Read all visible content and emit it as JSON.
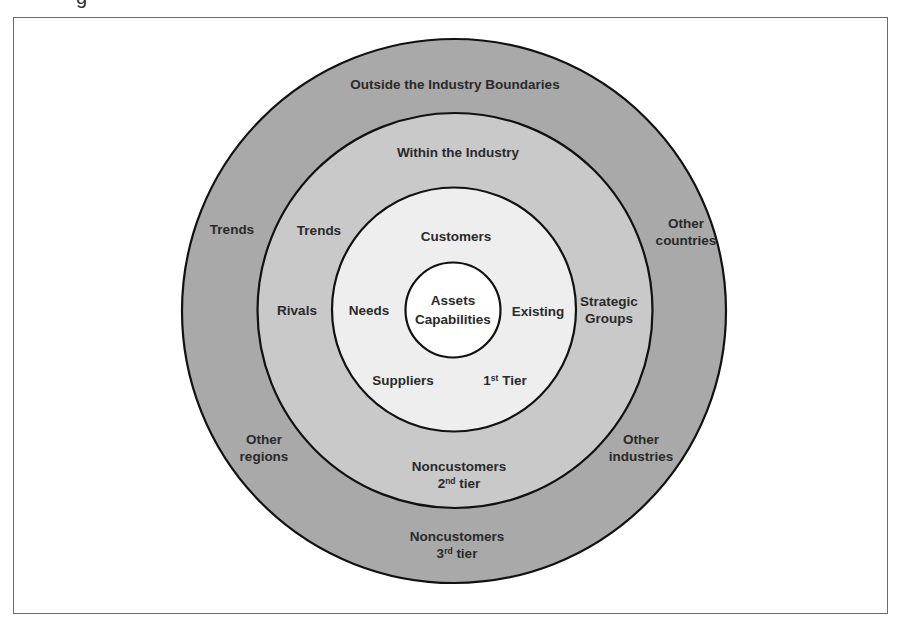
{
  "header": {
    "cut_off_glyph": "g"
  },
  "diagram": {
    "colors": {
      "outer_ring": "#a9a9a9",
      "middle_ring": "#c9c9c9",
      "inner_ring": "#eeeeee",
      "core": "#ffffff",
      "stroke": "#111111",
      "frame": "#6a6a6a"
    },
    "rings": {
      "outer": {
        "title": "Outside the Industry Boundaries"
      },
      "middle": {
        "title": "Within the Industry"
      },
      "inner": {
        "title": "Customers"
      },
      "core": {
        "line1": "Assets",
        "line2": "Capabilities"
      }
    },
    "labels": {
      "outer_trends": "Trends",
      "middle_trends": "Trends",
      "rivals": "Rivals",
      "needs": "Needs",
      "existing": "Existing",
      "suppliers": "Suppliers",
      "first_tier_num": "1",
      "first_tier_sup": "st",
      "first_tier_word": " Tier",
      "strategic_line1": "Strategic",
      "strategic_line2": "Groups",
      "other_countries_line1": "Other",
      "other_countries_line2": "countries",
      "other_regions_line1": "Other",
      "other_regions_line2": "regions",
      "other_industries_line1": "Other",
      "other_industries_line2": "industries",
      "noncust2_line1": "Noncustomers",
      "noncust2_num": "2",
      "noncust2_sup": "nd",
      "noncust2_word": " tier",
      "noncust3_line1": "Noncustomers",
      "noncust3_num": "3",
      "noncust3_sup": "rd",
      "noncust3_word": " tier"
    }
  }
}
